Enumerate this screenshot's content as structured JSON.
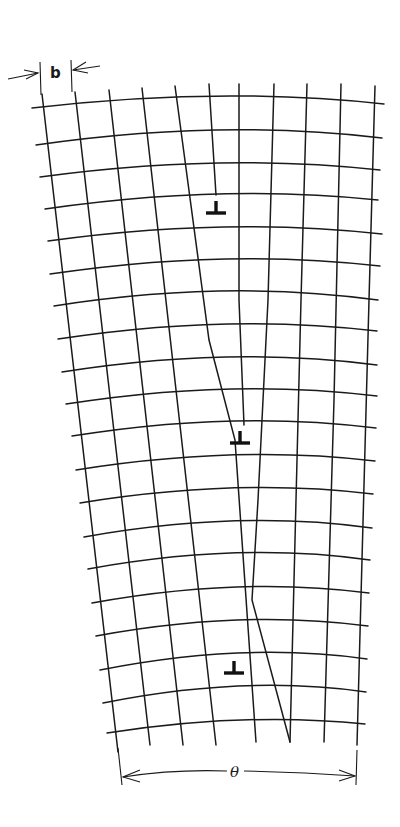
{
  "figure": {
    "labels": {
      "spacing": "b",
      "angle": "θ"
    },
    "symbol": {
      "dislocation": "⊥"
    }
  },
  "geometry": {
    "rows": [
      {
        "y_left": 108,
        "x_left": 32,
        "y_mid": 96,
        "y_right": 104,
        "x_right": 384
      },
      {
        "y_left": 145,
        "x_left": 36,
        "y_mid": 130,
        "y_right": 138,
        "x_right": 382
      },
      {
        "y_left": 177,
        "x_left": 40,
        "y_mid": 163,
        "y_right": 170,
        "x_right": 380
      },
      {
        "y_left": 209,
        "x_left": 45,
        "y_mid": 194,
        "y_right": 200,
        "x_right": 378
      },
      {
        "y_left": 241,
        "x_left": 48,
        "y_mid": 227,
        "y_right": 234,
        "x_right": 382
      },
      {
        "y_left": 274,
        "x_left": 50,
        "y_mid": 259,
        "y_right": 266,
        "x_right": 380
      },
      {
        "y_left": 306,
        "x_left": 54,
        "y_mid": 291,
        "y_right": 300,
        "x_right": 378
      },
      {
        "y_left": 339,
        "x_left": 58,
        "y_mid": 324,
        "y_right": 331,
        "x_right": 377
      },
      {
        "y_left": 372,
        "x_left": 62,
        "y_mid": 357,
        "y_right": 365,
        "x_right": 377
      },
      {
        "y_left": 404,
        "x_left": 66,
        "y_mid": 389,
        "y_right": 396,
        "x_right": 377
      },
      {
        "y_left": 436,
        "x_left": 72,
        "y_mid": 421,
        "y_right": 428,
        "x_right": 376
      },
      {
        "y_left": 470,
        "x_left": 76,
        "y_mid": 455,
        "y_right": 461,
        "x_right": 375
      },
      {
        "y_left": 503,
        "x_left": 80,
        "y_mid": 488,
        "y_right": 494,
        "x_right": 373
      },
      {
        "y_left": 537,
        "x_left": 84,
        "y_mid": 521,
        "y_right": 528,
        "x_right": 372
      },
      {
        "y_left": 569,
        "x_left": 88,
        "y_mid": 553,
        "y_right": 560,
        "x_right": 370
      },
      {
        "y_left": 603,
        "x_left": 92,
        "y_mid": 587,
        "y_right": 593,
        "x_right": 369
      },
      {
        "y_left": 636,
        "x_left": 96,
        "y_mid": 620,
        "y_right": 626,
        "x_right": 368
      },
      {
        "y_left": 670,
        "x_left": 100,
        "y_mid": 653,
        "y_right": 659,
        "x_right": 367
      },
      {
        "y_left": 703,
        "x_left": 103,
        "y_mid": 686,
        "y_right": 692,
        "x_right": 366
      },
      {
        "y_left": 733,
        "x_left": 107,
        "y_mid": 720,
        "y_right": 724,
        "x_right": 365
      }
    ],
    "columns": [
      {
        "pts": [
          [
            42,
            94
          ],
          [
            118,
            752
          ]
        ]
      },
      {
        "pts": [
          [
            75,
            92
          ],
          [
            150,
            745
          ]
        ]
      },
      {
        "pts": [
          [
            109,
            90
          ],
          [
            183,
            745
          ]
        ]
      },
      {
        "pts": [
          [
            142,
            88
          ],
          [
            216,
            745
          ]
        ]
      },
      {
        "pts": [
          [
            175,
            86
          ],
          [
            209,
            340
          ],
          [
            235,
            440
          ],
          [
            256,
            742
          ]
        ]
      },
      {
        "pts": [
          [
            209,
            84
          ],
          [
            216,
            195
          ]
        ]
      },
      {
        "pts": [
          [
            239,
            84
          ],
          [
            239,
            300
          ],
          [
            244,
            425
          ]
        ]
      },
      {
        "pts": [
          [
            274,
            84
          ],
          [
            268,
            300
          ],
          [
            258,
            500
          ],
          [
            252,
            600
          ],
          [
            290,
            742
          ]
        ]
      },
      {
        "pts": [
          [
            307,
            84
          ],
          [
            301,
            300
          ],
          [
            296,
            500
          ],
          [
            290,
            742
          ]
        ]
      },
      {
        "pts": [
          [
            341,
            84
          ],
          [
            334,
            400
          ],
          [
            324,
            742
          ]
        ]
      },
      {
        "pts": [
          [
            375,
            86
          ],
          [
            369,
            300
          ],
          [
            357,
            745
          ]
        ]
      }
    ],
    "dislocations": [
      {
        "x": 216,
        "y": 213
      },
      {
        "x": 240,
        "y": 443
      },
      {
        "x": 234,
        "y": 673
      }
    ]
  }
}
